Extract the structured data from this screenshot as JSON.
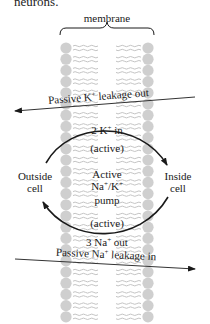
{
  "context_text": "neurons.",
  "diagram": {
    "membrane_label": "membrane",
    "colors": {
      "membrane": "#cfcfcf",
      "tail": "#c4c4c4",
      "ink": "#1a1a1a",
      "arrow": "#333333"
    },
    "passive_k": {
      "prefix": "Passive K",
      "sup": "+",
      "suffix": " leakage out",
      "direction": "out"
    },
    "passive_na": {
      "prefix": "Passive Na",
      "sup": "+",
      "suffix": " leakage in",
      "direction": "in"
    },
    "pump": {
      "top_ion": {
        "prefix": "2 K",
        "sup": "+",
        "suffix": " in"
      },
      "top_mode": "(active)",
      "center_line1": "Active",
      "center_line2_a": "Na",
      "center_line2_sup1": "+",
      "center_line2_b": "/K",
      "center_line2_sup2": "+",
      "center_line3": "pump",
      "bottom_mode": "(active)",
      "bottom_ion": {
        "prefix": "3 Na",
        "sup": "+",
        "suffix": " out"
      }
    },
    "outside_label": {
      "line1": "Outside",
      "line2": "cell"
    },
    "inside_label": {
      "line1": "Inside",
      "line2": "cell"
    }
  }
}
